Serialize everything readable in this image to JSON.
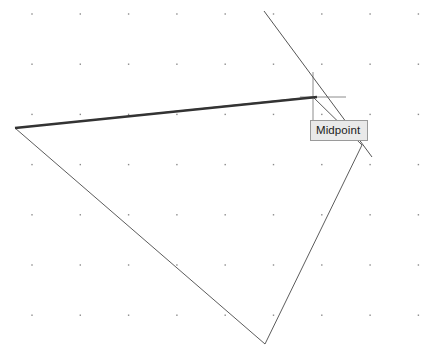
{
  "canvas": {
    "width": 426,
    "height": 356,
    "background_color": "#ffffff",
    "name": "geometry-drawing-canvas"
  },
  "grid": {
    "visible": true,
    "dot_color": "#8a8a8a",
    "dot_size": 1.4,
    "origin_x": 32,
    "origin_y": 14,
    "spacing_x": 48.3,
    "spacing_y": 50.2,
    "cols": 9,
    "rows": 7
  },
  "shape": {
    "name": "quadrilateral",
    "stroke_color": "#4a4a4a",
    "stroke_width": 0.9,
    "vertices": [
      {
        "label": "A",
        "x": 15,
        "y": 128
      },
      {
        "label": "B",
        "x": 313,
        "y": 97
      },
      {
        "label": "C",
        "x": 362,
        "y": 145
      },
      {
        "label": "D",
        "x": 265,
        "y": 344
      }
    ]
  },
  "selected_edge": {
    "name": "top-edge-highlighted",
    "from_x": 15,
    "from_y": 128,
    "to_x": 317,
    "to_y": 97,
    "stroke_color": "#333333",
    "stroke_width": 2.6
  },
  "construction_line": {
    "name": "diagonal-construction-line",
    "from_x": 264,
    "from_y": 11,
    "to_x": 372,
    "to_y": 157,
    "stroke_color": "#555555",
    "stroke_width": 1.0
  },
  "midpoint_marker": {
    "name": "midpoint-cross-marker",
    "stroke_color": "#8c8c8c",
    "stroke_width": 1.0,
    "vertical": {
      "x": 313,
      "y1": 72,
      "y2": 122
    },
    "horizontal": {
      "y": 97,
      "x1": 300,
      "x2": 346
    }
  },
  "tooltip": {
    "label": "Midpoint",
    "x": 310,
    "y": 120,
    "width": 58,
    "height": 21,
    "background_color": "#e9e9e9",
    "border_color": "#9a9a9a",
    "text_color": "#1a1a1a"
  }
}
